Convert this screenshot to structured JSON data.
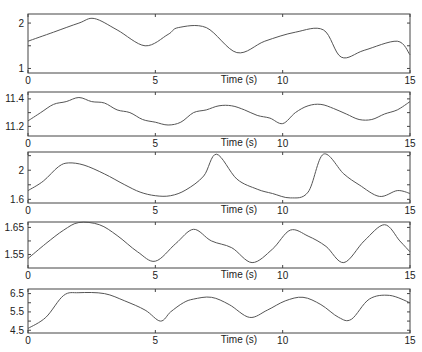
{
  "figure": {
    "xlabel": "Time (s)",
    "xlim": [
      0,
      15
    ],
    "xticks": [
      0,
      5,
      10,
      15
    ],
    "line_color": "#555555",
    "axis_color": "#444444"
  },
  "chart_data": [
    {
      "type": "line",
      "title": "",
      "xlabel": "Time (s)",
      "ylabel": "",
      "xlim": [
        0,
        15
      ],
      "ylim": [
        0.9,
        2.2
      ],
      "yticks": [
        1,
        1.5,
        2
      ],
      "ytick_labels": [
        "1",
        "",
        "2"
      ],
      "box": {
        "top": 14,
        "bottom": 73
      },
      "x": [
        0,
        1.0,
        2.0,
        2.6,
        3.5,
        4.6,
        5.5,
        5.9,
        7.0,
        8.2,
        9.3,
        10.5,
        11.6,
        12.3,
        13.2,
        14.5,
        15
      ],
      "values": [
        1.6,
        1.8,
        2.0,
        2.1,
        1.85,
        1.5,
        1.75,
        1.9,
        1.9,
        1.35,
        1.6,
        1.8,
        1.85,
        1.25,
        1.4,
        1.6,
        1.3
      ]
    },
    {
      "type": "line",
      "title": "",
      "xlabel": "Time (s)",
      "ylabel": "",
      "xlim": [
        0,
        15
      ],
      "ylim": [
        11.13,
        11.45
      ],
      "yticks": [
        11.2,
        11.3,
        11.4
      ],
      "ytick_labels": [
        "11.2",
        "",
        "11.4"
      ],
      "box": {
        "top": 92,
        "bottom": 136
      },
      "x": [
        0,
        0.5,
        1.0,
        1.5,
        2.0,
        2.5,
        3.0,
        3.5,
        4.0,
        4.5,
        5.0,
        5.5,
        6.0,
        6.5,
        7.0,
        7.5,
        8.0,
        8.5,
        9.0,
        9.5,
        10.0,
        10.5,
        11.0,
        11.5,
        12.0,
        12.5,
        13.0,
        13.5,
        14.0,
        14.5,
        15.0
      ],
      "values": [
        11.24,
        11.3,
        11.36,
        11.38,
        11.41,
        11.38,
        11.37,
        11.32,
        11.3,
        11.25,
        11.23,
        11.21,
        11.23,
        11.3,
        11.32,
        11.35,
        11.35,
        11.32,
        11.28,
        11.26,
        11.22,
        11.3,
        11.35,
        11.36,
        11.33,
        11.29,
        11.25,
        11.25,
        11.29,
        11.32,
        11.38
      ]
    },
    {
      "type": "line",
      "title": "",
      "xlabel": "Time (s)",
      "ylabel": "",
      "xlim": [
        0,
        15
      ],
      "ylim": [
        1.55,
        2.25
      ],
      "yticks": [
        1.6,
        1.8,
        2.0,
        2.2
      ],
      "ytick_labels": [
        "1.6",
        "",
        "2",
        ""
      ],
      "box": {
        "top": 152,
        "bottom": 203
      },
      "x": [
        0,
        0.6,
        1.2,
        1.6,
        2.2,
        3.0,
        3.8,
        4.4,
        5.0,
        5.6,
        6.2,
        6.9,
        7.4,
        8.2,
        9.0,
        9.6,
        10.3,
        11.0,
        11.6,
        12.4,
        13.0,
        13.8,
        14.5,
        15
      ],
      "values": [
        1.72,
        1.85,
        2.05,
        2.1,
        2.07,
        1.95,
        1.8,
        1.7,
        1.65,
        1.65,
        1.73,
        1.92,
        2.22,
        1.88,
        1.74,
        1.68,
        1.62,
        1.7,
        2.22,
        1.95,
        1.8,
        1.64,
        1.72,
        1.68
      ]
    },
    {
      "type": "line",
      "title": "",
      "xlabel": "Time (s)",
      "ylabel": "",
      "xlim": [
        0,
        15
      ],
      "ylim": [
        1.5,
        1.67
      ],
      "yticks": [
        1.55,
        1.6,
        1.65
      ],
      "ytick_labels": [
        "1.55",
        "",
        "1.65"
      ],
      "box": {
        "top": 222,
        "bottom": 268
      },
      "x": [
        0,
        0.7,
        1.4,
        2.0,
        2.8,
        3.5,
        4.3,
        5.0,
        5.8,
        6.5,
        7.2,
        8.0,
        8.8,
        9.6,
        10.3,
        11.0,
        11.7,
        12.4,
        13.2,
        14.0,
        14.6,
        15
      ],
      "values": [
        1.535,
        1.59,
        1.64,
        1.668,
        1.66,
        1.62,
        1.56,
        1.525,
        1.59,
        1.643,
        1.6,
        1.575,
        1.52,
        1.57,
        1.64,
        1.618,
        1.58,
        1.52,
        1.6,
        1.66,
        1.6,
        1.56
      ]
    },
    {
      "type": "line",
      "title": "",
      "xlabel": "Time (s)",
      "ylabel": "",
      "xlim": [
        0,
        15
      ],
      "ylim": [
        4.35,
        6.75
      ],
      "yticks": [
        4.5,
        5.0,
        5.5,
        6.0,
        6.5
      ],
      "ytick_labels": [
        "4.5",
        "",
        "5.5",
        "",
        "6.5"
      ],
      "box": {
        "top": 289,
        "bottom": 333
      },
      "x": [
        0,
        0.7,
        1.4,
        2.0,
        3.0,
        3.8,
        4.6,
        5.2,
        5.6,
        6.1,
        6.5,
        7.2,
        7.9,
        8.7,
        9.4,
        10.1,
        10.8,
        11.5,
        12.2,
        12.7,
        13.4,
        14.2,
        15
      ],
      "values": [
        4.6,
        5.2,
        6.4,
        6.55,
        6.5,
        6.1,
        5.6,
        5.0,
        5.5,
        6.0,
        6.2,
        6.3,
        5.9,
        5.2,
        5.6,
        6.1,
        6.3,
        5.9,
        5.2,
        5.1,
        6.2,
        6.4,
        6.0
      ]
    }
  ]
}
